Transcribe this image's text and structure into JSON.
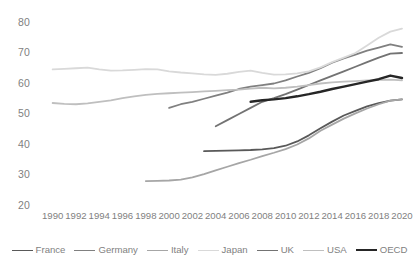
{
  "chart_data": {
    "type": "line",
    "title": "",
    "subtitle": "",
    "xlabel": "",
    "ylabel": "",
    "xlim": [
      1989,
      2020.6
    ],
    "ylim": [
      20,
      80
    ],
    "grid": false,
    "legend_position": "bottom",
    "x_ticks": [
      "1990",
      "1992",
      "1994",
      "1996",
      "1998",
      "2000",
      "2002",
      "2004",
      "2006",
      "2008",
      "2010",
      "2012",
      "2014",
      "2016",
      "2018",
      "2020"
    ],
    "y_ticks": [
      "20",
      "30",
      "40",
      "50",
      "60",
      "70",
      "80"
    ],
    "series": [
      {
        "name": "France",
        "color": "#595959",
        "width": 1.8,
        "x": [
          2003,
          2004,
          2005,
          2006,
          2007,
          2008,
          2009,
          2010,
          2011,
          2012,
          2013,
          2014,
          2015,
          2016,
          2017,
          2018,
          2019,
          2020
        ],
        "values": [
          37.8,
          37.9,
          38.0,
          38.1,
          38.2,
          38.4,
          38.8,
          39.6,
          41.0,
          43.0,
          45.3,
          47.5,
          49.5,
          51.0,
          52.5,
          53.6,
          54.4,
          54.8
        ]
      },
      {
        "name": "Germany",
        "color": "#808080",
        "width": 1.8,
        "x": [
          2000,
          2001,
          2002,
          2003,
          2004,
          2005,
          2006,
          2007,
          2008,
          2009,
          2010,
          2011,
          2012,
          2013,
          2014,
          2015,
          2016,
          2017,
          2018,
          2019,
          2020
        ],
        "values": [
          52.0,
          53.2,
          54.0,
          55.0,
          56.0,
          57.0,
          58.2,
          59.0,
          59.5,
          60.0,
          61.0,
          62.3,
          63.5,
          65.0,
          66.8,
          68.2,
          69.5,
          70.8,
          71.8,
          72.8,
          72.0
        ]
      },
      {
        "name": "Italy",
        "color": "#a6a6a6",
        "width": 1.8,
        "x": [
          1998,
          1999,
          2000,
          2001,
          2002,
          2003,
          2004,
          2005,
          2006,
          2007,
          2008,
          2009,
          2010,
          2011,
          2012,
          2013,
          2014,
          2015,
          2016,
          2017,
          2018,
          2019,
          2020
        ],
        "values": [
          28.0,
          28.1,
          28.2,
          28.5,
          29.2,
          30.3,
          31.5,
          32.7,
          33.9,
          35.0,
          36.2,
          37.3,
          38.5,
          40.0,
          42.0,
          44.5,
          46.5,
          48.5,
          50.2,
          51.8,
          53.2,
          54.4,
          54.8
        ]
      },
      {
        "name": "Japan",
        "color": "#d9d9d9",
        "width": 1.8,
        "x": [
          1990,
          1991,
          1992,
          1993,
          1994,
          1995,
          1996,
          1997,
          1998,
          1999,
          2000,
          2001,
          2002,
          2003,
          2004,
          2005,
          2006,
          2007,
          2008,
          2009,
          2010,
          2011,
          2012,
          2013,
          2014,
          2015,
          2016,
          2017,
          2018,
          2019,
          2020
        ],
        "values": [
          64.6,
          64.8,
          65.0,
          65.2,
          64.6,
          64.2,
          64.3,
          64.5,
          64.7,
          64.6,
          64.0,
          63.6,
          63.3,
          63.0,
          62.8,
          63.2,
          63.8,
          64.2,
          63.5,
          62.9,
          63.0,
          63.3,
          64.0,
          65.3,
          67.0,
          68.5,
          70.0,
          72.5,
          75.0,
          77.0,
          78.0
        ]
      },
      {
        "name": "UK",
        "color": "#737373",
        "width": 1.8,
        "x": [
          2004,
          2005,
          2006,
          2007,
          2008,
          2009,
          2010,
          2011,
          2012,
          2013,
          2014,
          2015,
          2016,
          2017,
          2018,
          2019,
          2020
        ],
        "values": [
          46.0,
          48.0,
          50.0,
          52.0,
          54.0,
          55.2,
          56.5,
          58.0,
          59.5,
          61.0,
          62.5,
          64.0,
          65.5,
          67.0,
          68.5,
          69.8,
          70.0
        ]
      },
      {
        "name": "USA",
        "color": "#bfbfbf",
        "width": 1.8,
        "x": [
          1990,
          1991,
          1992,
          1993,
          1994,
          1995,
          1996,
          1997,
          1998,
          1999,
          2000,
          2001,
          2002,
          2003,
          2004,
          2005,
          2006,
          2007,
          2008,
          2009,
          2010,
          2011,
          2012,
          2013,
          2014,
          2015,
          2016,
          2017,
          2018,
          2019,
          2020
        ],
        "values": [
          53.6,
          53.3,
          53.2,
          53.5,
          54.0,
          54.5,
          55.2,
          55.8,
          56.3,
          56.6,
          56.8,
          57.0,
          57.2,
          57.4,
          57.6,
          57.8,
          58.0,
          58.3,
          58.6,
          58.4,
          58.6,
          59.0,
          59.5,
          60.0,
          60.4,
          60.6,
          60.8,
          61.0,
          61.2,
          61.3,
          61.0
        ]
      },
      {
        "name": "OECD",
        "color": "#262626",
        "width": 2.4,
        "x": [
          2007,
          2008,
          2009,
          2010,
          2011,
          2012,
          2013,
          2014,
          2015,
          2016,
          2017,
          2018,
          2019,
          2020
        ],
        "values": [
          54.0,
          54.5,
          54.8,
          55.2,
          55.8,
          56.5,
          57.3,
          58.2,
          59.0,
          59.8,
          60.6,
          61.4,
          62.6,
          61.8
        ]
      }
    ]
  },
  "legend": {
    "items": [
      {
        "label": "France"
      },
      {
        "label": "Germany"
      },
      {
        "label": "Italy"
      },
      {
        "label": "Japan"
      },
      {
        "label": "UK"
      },
      {
        "label": "USA"
      },
      {
        "label": "OECD"
      }
    ]
  }
}
